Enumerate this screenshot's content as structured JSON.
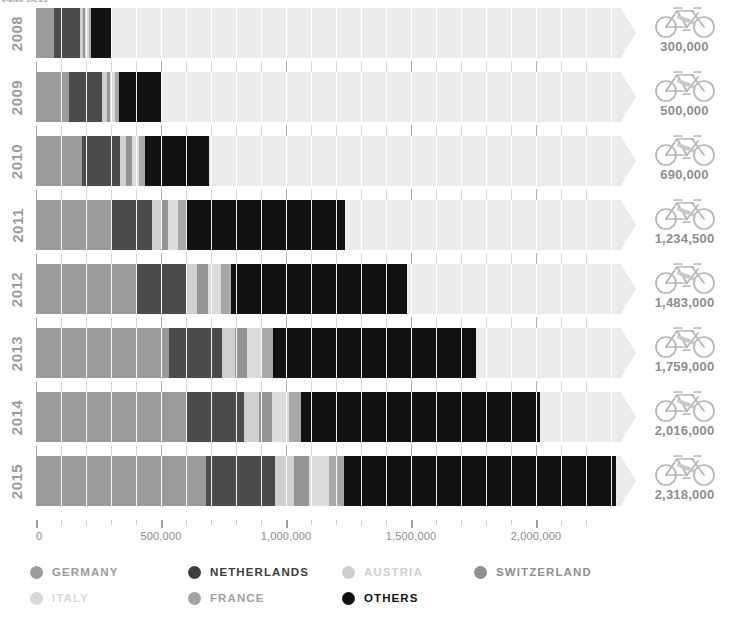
{
  "caption": "E-BIKE SALES",
  "chart_data": {
    "type": "bar",
    "orientation": "horizontal",
    "stacked": true,
    "title": "E-BIKE SALES",
    "xlabel": "",
    "ylabel": "",
    "xlim": [
      0,
      2400000
    ],
    "grid": true,
    "legend_position": "bottom",
    "categories": [
      "2008",
      "2009",
      "2010",
      "2011",
      "2012",
      "2013",
      "2014",
      "2015"
    ],
    "tick_labels": [
      "0",
      "500,000",
      "1,000,000",
      "1,500,000",
      "2,000,000"
    ],
    "tick_values": [
      0,
      500000,
      1000000,
      1500000,
      2000000
    ],
    "minor_tick_step": 100000,
    "totals": [
      300000,
      500000,
      690000,
      1234500,
      1483000,
      2016000,
      2016000,
      2318000
    ],
    "total_labels": [
      "300,000",
      "500,000",
      "690,000",
      "1,234,500",
      "1,483,000",
      "1,759,000",
      "2,016,000",
      "2,318,000"
    ],
    "series": [
      {
        "name": "GERMANY",
        "color": "#9b9b9b",
        "values": [
          70000,
          130000,
          185000,
          300000,
          400000,
          530000,
          600000,
          680000
        ]
      },
      {
        "name": "NETHERLANDS",
        "color": "#4b4b4b",
        "values": [
          105000,
          135000,
          150000,
          165000,
          200000,
          215000,
          230000,
          275000
        ]
      },
      {
        "name": "AUSTRIA",
        "color": "#d0d0d0",
        "values": [
          12000,
          18000,
          26000,
          34000,
          45000,
          50000,
          60000,
          75000
        ]
      },
      {
        "name": "SWITZERLAND",
        "color": "#949494",
        "values": [
          10000,
          14000,
          22000,
          30000,
          42000,
          48000,
          55000,
          63000
        ]
      },
      {
        "name": "ITALY",
        "color": "#dcdcdc",
        "values": [
          13000,
          20000,
          30000,
          40000,
          52000,
          58000,
          65000,
          78000
        ]
      },
      {
        "name": "FRANCE",
        "color": "#a8a8a8",
        "values": [
          10000,
          16000,
          24000,
          32000,
          40000,
          45000,
          50000,
          62000
        ]
      },
      {
        "name": "OTHERS",
        "color": "#111111",
        "values": [
          80000,
          167000,
          253000,
          633500,
          704000,
          813000,
          956000,
          1085000
        ]
      }
    ]
  },
  "axis": {
    "labels": [
      {
        "value": 0,
        "text": "0"
      },
      {
        "value": 500000,
        "text": "500,000"
      },
      {
        "value": 1000000,
        "text": "1,000,000"
      },
      {
        "value": 1500000,
        "text": "1,500,000"
      },
      {
        "value": 2000000,
        "text": "2,000,000"
      }
    ]
  },
  "years": [
    {
      "label": "2008"
    },
    {
      "label": "2009"
    },
    {
      "label": "2010"
    },
    {
      "label": "2011"
    },
    {
      "label": "2012"
    },
    {
      "label": "2013"
    },
    {
      "label": "2014"
    },
    {
      "label": "2015"
    }
  ],
  "totals": [
    {
      "label": "300,000",
      "icon": "bicycle-icon"
    },
    {
      "label": "500,000",
      "icon": "bicycle-icon"
    },
    {
      "label": "690,000",
      "icon": "bicycle-icon"
    },
    {
      "label": "1,234,500",
      "icon": "bicycle-icon"
    },
    {
      "label": "1,483,000",
      "icon": "bicycle-icon"
    },
    {
      "label": "1,759,000",
      "icon": "bicycle-icon"
    },
    {
      "label": "2,016,000",
      "icon": "bicycle-icon"
    },
    {
      "label": "2,318,000",
      "icon": "bicycle-icon"
    }
  ],
  "legend": {
    "rows": [
      [
        {
          "label": "GERMANY",
          "color": "#9b9b9b",
          "text_color": "#9b9b9b",
          "left": 0
        },
        {
          "label": "NETHERLANDS",
          "color": "#3d3d3d",
          "text_color": "#3d3d3d",
          "left": 158
        },
        {
          "label": "AUSTRIA",
          "color": "#cfcfcf",
          "text_color": "#cfcfcf",
          "left": 312
        },
        {
          "label": "SWITZERLAND",
          "color": "#8f8f8f",
          "text_color": "#8f8f8f",
          "left": 444
        }
      ],
      [
        {
          "label": "ITALY",
          "color": "#d8d8d8",
          "text_color": "#d8d8d8",
          "left": 0
        },
        {
          "label": "FRANCE",
          "color": "#a2a2a2",
          "text_color": "#a2a2a2",
          "left": 158
        },
        {
          "label": "OTHERS",
          "color": "#111111",
          "text_color": "#111111",
          "left": 312
        }
      ]
    ]
  },
  "colors": {
    "track": "#ebebeb",
    "background": "#ffffff",
    "text": "#8c8c8c",
    "gridline": "#ffffff"
  }
}
